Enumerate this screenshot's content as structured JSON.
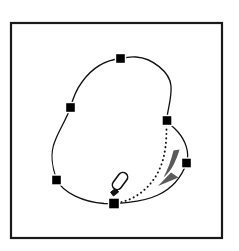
{
  "figure": {
    "canvas": {
      "width": 239,
      "height": 251,
      "background": "#ffffff"
    },
    "frame": {
      "name": "figure-border",
      "x": 11,
      "y": 23,
      "width": 211,
      "height": 215,
      "stroke": "#1a1a1a",
      "stroke_width": 2.2,
      "fill": "#ffffff"
    },
    "spline": {
      "name": "closed-spline-curve",
      "stroke": "#111111",
      "stroke_width": 1.3,
      "fill": "none",
      "closed": true,
      "path": "M 120.5 58.5 C 106 60 92 68 82 82 C 76 90 73 98 70.5 107.5 C 66 120 59 130 55 141 C 50 153 52 168 57 180 C 63 193 84 202 104 203.5 C 114 204 141 203 158 195 C 173 188 182 176 186.5 163 C 190 152 185 140 178 132 C 172 125 168 124 167 120.5 C 166.5 112 172 100 171 86 C 170 72 152 58 136 57 C 130 56.5 125 57.5 120.5 58.5 Z"
    },
    "control_points": [
      {
        "id": "cp-top",
        "label": "top control point",
        "x": 120.5,
        "y": 58.5,
        "size": 10
      },
      {
        "id": "cp-upper-left",
        "label": "upper-left control point",
        "x": 70.5,
        "y": 107.5,
        "size": 10
      },
      {
        "id": "cp-lower-left",
        "label": "lower-left control point",
        "x": 56.5,
        "y": 180.0,
        "size": 10
      },
      {
        "id": "cp-bottom",
        "label": "bottom control point",
        "x": 114.0,
        "y": 203.5,
        "size": 11
      },
      {
        "id": "cp-lower-right",
        "label": "lower-right control point",
        "x": 186.5,
        "y": 163.0,
        "size": 10
      },
      {
        "id": "cp-upper-right",
        "label": "upper-right control point",
        "x": 167.0,
        "y": 120.5,
        "size": 10
      }
    ],
    "control_point_style": {
      "fill": "#000000",
      "stroke": "#ffffff",
      "stroke_width": 1.4
    },
    "drag_trajectory": {
      "name": "dotted-drag-path",
      "from": "cp-bottom",
      "to": "cp-upper-right",
      "stroke": "#141414",
      "stroke_width": 1.9,
      "dash_array": "0.2 4.2",
      "line_cap": "round",
      "path": "M 117 203 C 136 200 154 186 162 163 C 167 147 166.5 132 166.5 122"
    },
    "drag_arrow": {
      "name": "drag-direction-arrow",
      "fill": "#5a5a5a",
      "stroke": "none",
      "shaft_path": "M 173.5 150.5 C 171 161 167.5 170 163.5 177.5 C 167.5 174 171 170 173.5 165 C 177 158 178.5 153 179.5 149.5 Z",
      "head_path": "M 158 186 L 178.5 177.5 L 171 172.5 Z"
    },
    "stylus": {
      "name": "stylus-pen",
      "body_fill": "#ffffff",
      "body_stroke": "#111111",
      "body_stroke_width": 1.6,
      "tip_fill": "#111111",
      "rotation_deg": 37,
      "body": {
        "cx": 120.0,
        "cy": 181.0,
        "length": 19,
        "width": 9.5
      },
      "tip_path": "M 110.6 192.2 L 115.8 188.2 L 118.6 192.0 L 113.4 196.0 Z"
    }
  }
}
